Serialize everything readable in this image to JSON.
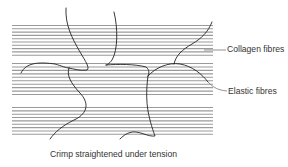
{
  "diagram": {
    "type": "tissue-structure-illustration",
    "labels": {
      "collagen": "Collagen fibres",
      "elastic": "Elastic fibres",
      "caption": "Crimp straightened under tension"
    },
    "collagen_lines": {
      "x_start": 12,
      "x_end": 213,
      "groups": [
        {
          "y_start": 25.5,
          "count": 10,
          "spacing": 3.3
        },
        {
          "y_start": 63.5,
          "count": 10,
          "spacing": 3.45
        },
        {
          "y_start": 107.5,
          "count": 9,
          "spacing": 3.35
        }
      ],
      "color": "#9a9a9a"
    },
    "elastic_fibre_color": "#222222",
    "leader_color": "#777777"
  }
}
